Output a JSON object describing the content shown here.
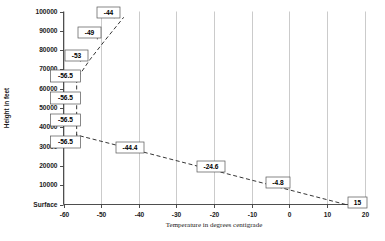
{
  "chart_data": {
    "type": "line",
    "title": "",
    "xlabel": "Temperature in degrees centigrade",
    "ylabel": "Height in feet",
    "xlim": [
      -60,
      20
    ],
    "ylim": [
      0,
      100000
    ],
    "grid": "vertical",
    "legend": "none",
    "linestyle": "dashed",
    "x_ticks": [
      "-60",
      "-50",
      "-40",
      "-30",
      "-20",
      "-10",
      "0",
      "10",
      "20"
    ],
    "x_tick_values": [
      -60,
      -50,
      -40,
      -30,
      -20,
      -10,
      0,
      10,
      20
    ],
    "y_ticks": [
      "Surface",
      "10000",
      "20000",
      "30000",
      "40000",
      "50000",
      "60000",
      "70000",
      "80000",
      "90000",
      "100000"
    ],
    "y_tick_values": [
      0,
      10000,
      20000,
      30000,
      40000,
      50000,
      60000,
      70000,
      80000,
      90000,
      100000
    ],
    "series": [
      {
        "name": "Standard atmosphere temperature profile",
        "x": [
          15,
          -4.8,
          -24.6,
          -44.4,
          -56.5,
          -56.5,
          -56.5,
          -56.5,
          -53,
          -49,
          -44
        ],
        "y": [
          0,
          10000,
          20000,
          30000,
          36000,
          45000,
          55000,
          65000,
          75000,
          85000,
          97000
        ],
        "labels": [
          "15",
          "-4.8",
          "-24.6",
          "-44.4",
          "-56.5",
          "-56.5",
          "-56.5",
          "-56.5",
          "-53",
          "-49",
          "-44"
        ]
      }
    ],
    "annotations": [
      {
        "label": "-44",
        "x": 97.0,
        "y": 7.0,
        "w": 23,
        "h": 11,
        "anchor_x": -46.5,
        "anchor_y": 96500
      },
      {
        "label": "-49",
        "x": 78.0,
        "y": 27.0,
        "w": 23,
        "h": 11,
        "anchor_x": -51.0,
        "anchor_y": 85500
      },
      {
        "label": "-53",
        "x": 65.0,
        "y": 50.0,
        "w": 23,
        "h": 11,
        "anchor_x": -55.5,
        "anchor_y": 74000
      },
      {
        "label": "-56.5",
        "x": 50.5,
        "y": 70.0,
        "w": 30,
        "h": 12,
        "anchor_x": -56.5,
        "anchor_y": 66500
      },
      {
        "label": "-56.5",
        "x": 50.5,
        "y": 92.0,
        "w": 30,
        "h": 12,
        "anchor_x": -56.5,
        "anchor_y": 55000
      },
      {
        "label": "-56.5",
        "x": 50.5,
        "y": 114.0,
        "w": 30,
        "h": 12,
        "anchor_x": -56.5,
        "anchor_y": 45000
      },
      {
        "label": "-56.5",
        "x": 50.5,
        "y": 136.0,
        "w": 30,
        "h": 12,
        "anchor_x": -56.5,
        "anchor_y": 36500
      },
      {
        "label": "-44.4",
        "x": 116.0,
        "y": 142.0,
        "w": 28,
        "h": 11,
        "anchor_x": -44.4,
        "anchor_y": 30000
      },
      {
        "label": "-24.6",
        "x": 197.0,
        "y": 161.0,
        "w": 28,
        "h": 11,
        "anchor_x": -24.6,
        "anchor_y": 20000
      },
      {
        "label": "-4.8",
        "x": 266.0,
        "y": 177.0,
        "w": 24,
        "h": 11,
        "anchor_x": -4.8,
        "anchor_y": 10000
      },
      {
        "label": "15",
        "x": 348.0,
        "y": 197.0,
        "w": 19,
        "h": 11,
        "anchor_x": 15.0,
        "anchor_y": 0
      }
    ],
    "colors": {
      "line": "#2b2b2b",
      "grid": "#b9b9b9",
      "axis": "#3a3a3a",
      "callout_border": "#555555",
      "callout_fill": "#ffffff",
      "background": "#ffffff"
    }
  }
}
